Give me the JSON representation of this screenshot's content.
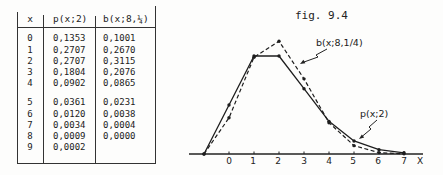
{
  "table": {
    "headers": {
      "x": "x",
      "p": "p(x;2)",
      "b": "b(x;8,¼)"
    },
    "rows": [
      {
        "x": "0",
        "p": "0,1353",
        "b": "0,1001"
      },
      {
        "x": "1",
        "p": "0,2707",
        "b": "0,2670"
      },
      {
        "x": "2",
        "p": "0,2707",
        "b": "0,3115"
      },
      {
        "x": "3",
        "p": "0,1804",
        "b": "0,2076"
      },
      {
        "x": "4",
        "p": "0,0902",
        "b": "0,0865"
      },
      {
        "x": "5",
        "p": "0,0361",
        "b": "0,0231"
      },
      {
        "x": "6",
        "p": "0,0120",
        "b": "0,0038"
      },
      {
        "x": "7",
        "p": "0,0034",
        "b": "0,0004"
      },
      {
        "x": "8",
        "p": "0,0009",
        "b": "0,0000"
      },
      {
        "x": "9",
        "p": "0,0002",
        "b": ""
      }
    ]
  },
  "chart_data": {
    "type": "line",
    "title": "fig. 9.4",
    "xlabel": "X",
    "ylabel": "",
    "x": [
      -1,
      0,
      1,
      2,
      3,
      4,
      5,
      6,
      7
    ],
    "xticks": [
      "0",
      "1",
      "2",
      "3",
      "4",
      "5",
      "6",
      "7"
    ],
    "xlim": [
      -1.6,
      7.8
    ],
    "ylim": [
      0,
      0.32
    ],
    "grid": false,
    "legend": "inline leader annotations",
    "series": [
      {
        "name": "p(x;2)",
        "style": "solid",
        "values": [
          0,
          0.1353,
          0.2707,
          0.2707,
          0.1804,
          0.0902,
          0.0361,
          0.012,
          0.0034
        ]
      },
      {
        "name": "b(x;8,1/4)",
        "style": "dashed",
        "values": [
          0,
          0.1001,
          0.267,
          0.3115,
          0.2076,
          0.0865,
          0.0231,
          0.0038,
          0.0004
        ]
      }
    ],
    "annotations": {
      "b_label": "b(x;8,1/4)",
      "p_label": "p(x;2)"
    },
    "colors": {
      "ink": "#222222",
      "background": "#fdfdfc"
    }
  }
}
